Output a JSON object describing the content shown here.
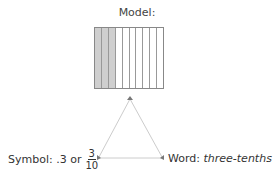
{
  "model": {
    "label": "Model:",
    "columns": 10,
    "shaded": 3
  },
  "symbol": {
    "prefix": "Symbol: .3 or",
    "numerator": "3",
    "denominator": "10"
  },
  "word": {
    "prefix": "Word:",
    "value": "three-tenths"
  },
  "colors": {
    "shaded": "#cfcfcf",
    "triangle_line": "#cccccc",
    "text": "#333333"
  }
}
